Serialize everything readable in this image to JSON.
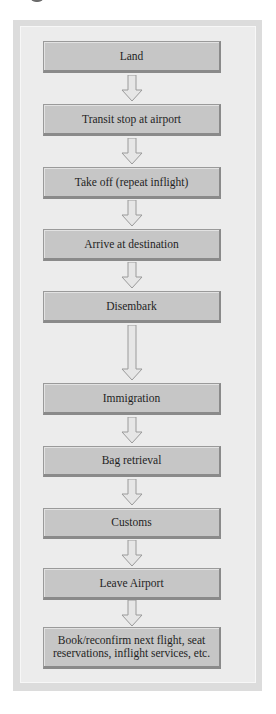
{
  "diagram": {
    "type": "flowchart",
    "direction": "top-to-bottom",
    "steps": [
      {
        "label": "Land"
      },
      {
        "label": "Transit stop at airport"
      },
      {
        "label": "Take off (repeat inflight)"
      },
      {
        "label": "Arrive at destination"
      },
      {
        "label": "Disembark"
      },
      {
        "label": "Immigration"
      },
      {
        "label": "Bag retrieval"
      },
      {
        "label": "Customs"
      },
      {
        "label": "Leave Airport"
      },
      {
        "label": "Book/reconfirm next flight, seat reservations, inflight services, etc."
      }
    ],
    "colors": {
      "panel_bg": "#ececec",
      "panel_border": "#dcdcdc",
      "box_fill": "#c6c6c6",
      "box_border": "#8a8a8a",
      "arrow_fill": "#e6e6e6",
      "arrow_stroke": "#9a9a9a",
      "text": "#1f1f1f"
    }
  }
}
